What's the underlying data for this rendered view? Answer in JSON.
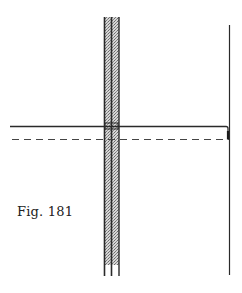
{
  "figure": {
    "caption": "Fig. 181",
    "colors": {
      "ink": "#2a2a2a",
      "strip_fill": "#b8b8b8",
      "background": "#ffffff"
    },
    "strip": {
      "x_left": 104,
      "x_mid": 111,
      "x_right": 119,
      "y_top": 17,
      "y_shade_bottom": 265,
      "y_bottom": 276
    },
    "solid_line": {
      "x1": 10,
      "x2": 227,
      "y": 126,
      "y_corner_bottom": 139
    },
    "dashed_line": {
      "x1": 12,
      "x2": 229,
      "y": 139
    },
    "right_vertical": {
      "x": 229,
      "y1": 25,
      "y2": 275
    }
  }
}
